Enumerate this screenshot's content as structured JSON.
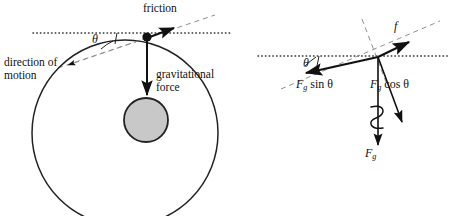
{
  "figure": {
    "background_color": "#ffffff",
    "stroke_color": "#111111",
    "dashed_color": "#8c8c8c",
    "dotted_color": "#333333",
    "sphere_fill_color": "#c8c8c8",
    "width": 450,
    "height": 216
  },
  "left_panel": {
    "name": "rolling-wheel-diagram",
    "labels": {
      "friction": "friction",
      "direction_of_motion": "direction of motion",
      "gravitational_force": "gravitational force",
      "theta": "θ"
    },
    "geometry": {
      "outer_circle": {
        "cx": 125,
        "cy": 133,
        "r": 93
      },
      "inner_circle": {
        "cx": 146,
        "cy": 120,
        "r": 22
      },
      "contact_point": {
        "x": 147,
        "y": 38
      },
      "horizontal_dotted_line": {
        "x1": 33,
        "y1": 33,
        "x2": 232,
        "y2": 33
      },
      "tangent_dashed_line": {
        "x1": 60,
        "y1": 67,
        "x2": 213,
        "y2": 16
      },
      "friction_arrow": {
        "x1": 147,
        "y1": 38,
        "x2": 178,
        "y2": 26
      },
      "motion_arrow": {
        "x1": 147,
        "y1": 38,
        "x2": 64,
        "y2": 66
      },
      "gravity_arrow": {
        "x1": 147,
        "y1": 38,
        "x2": 147,
        "y2": 97
      }
    }
  },
  "right_panel": {
    "name": "force-decomposition-diagram",
    "labels": {
      "friction_symbol": "f",
      "fg_sin_theta": {
        "base": "F",
        "sub": "g",
        "rest": "sin θ"
      },
      "fg_cos_theta": {
        "base": "F",
        "sub": "g",
        "rest": "cos θ"
      },
      "fg": {
        "base": "F",
        "sub": "g"
      },
      "theta": "θ"
    },
    "geometry": {
      "origin": {
        "x": 378,
        "y": 57
      },
      "horizontal_dotted_line": {
        "x1": 258,
        "y1": 56,
        "x2": 450,
        "y2": 56
      },
      "incline_dashed_line": {
        "x1": 282,
        "y1": 88,
        "x2": 438,
        "y2": 22
      },
      "normal_dashed_line": {
        "x1": 363,
        "y1": 20,
        "x2": 385,
        "y2": 78
      },
      "friction_arrow": {
        "x1": 378,
        "y1": 57,
        "x2": 412,
        "y2": 41
      },
      "fg_sin_arrow": {
        "x1": 378,
        "y1": 57,
        "x2": 303,
        "y2": 74
      },
      "fg_cos_arrow": {
        "x1": 378,
        "y1": 57,
        "x2": 404,
        "y2": 126
      },
      "fg_vertical_arrow": {
        "x1": 378,
        "y1": 57,
        "x2": 378,
        "y2": 148
      },
      "coil_marker": {
        "cx": 378,
        "cy": 120,
        "turns": 2
      }
    }
  }
}
